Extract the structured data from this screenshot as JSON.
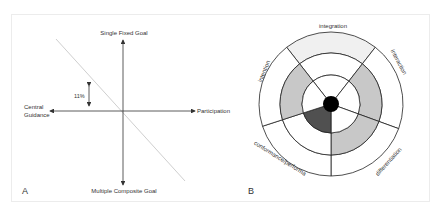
{
  "panel_a": {
    "letter": "A",
    "axis_top": "Single Fixed Goal",
    "axis_bottom": "Multiple Composite Goal",
    "axis_left_line1": "Central",
    "axis_left_line2": "Guidance",
    "axis_right": "Participation",
    "offset_label": "11%"
  },
  "panel_b": {
    "letter": "B",
    "segments": [
      {
        "label": "integration",
        "outer_fill": "#f0f0f0",
        "middle_fill": "#ffffff",
        "inner_fill": "#ffffff"
      },
      {
        "label": "interaction",
        "outer_fill": "#ffffff",
        "middle_fill": "#c8c8c8",
        "inner_fill": "#ffffff"
      },
      {
        "label": "differentiation",
        "outer_fill": "#ffffff",
        "middle_fill": "#c8c8c8",
        "inner_fill": "#ffffff"
      },
      {
        "label": "conformance/performa",
        "outer_fill": "#ffffff",
        "middle_fill": "#ffffff",
        "inner_fill": "#505050"
      },
      {
        "label": "intention",
        "outer_fill": "#ffffff",
        "middle_fill": "#c8c8c8",
        "inner_fill": "#ffffff"
      }
    ],
    "center_fill": "#000000"
  }
}
